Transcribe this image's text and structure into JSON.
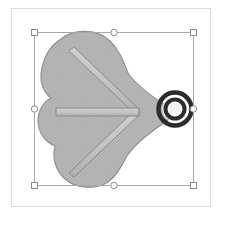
{
  "app": {
    "background_color": "#ffffff",
    "canvas": {
      "name": "drawing-canvas",
      "background_color": "#ffffff",
      "border_color": "#dcdcdc",
      "x": 11,
      "y": 8,
      "width": 200,
      "height": 199
    }
  },
  "artwork": {
    "title": "",
    "blob": {
      "name": "cloud-blob-shape",
      "fill_color": "#b4b4b4",
      "stroke_color": "#8e8e8e",
      "texture": "dither-halftone",
      "description": "three-lobed cloud shape tapering to a point on the right"
    },
    "arrow": {
      "name": "arrow-glyph",
      "fill_color": "#c2c2c2",
      "stroke_color": "#8a8a8a",
      "description": "rightward arrow: horizontal shaft with two diagonal barbs meeting at a point"
    },
    "target": {
      "name": "concentric-ring-target",
      "outer_ring_color": "#2b2b2b",
      "gap_color": "#ffffff",
      "inner_ring_color": "#2b2b2b",
      "center_color": "#f2f2f2",
      "center_x": 174,
      "center_y": 108,
      "outer_radius": 17
    }
  },
  "selection": {
    "name": "selection-bounding-box",
    "line_color": "#a8a8a8",
    "handle_fill": "#ffffff",
    "handle_stroke": "#8c8c8c",
    "box": {
      "left": 33,
      "top": 31,
      "right": 192,
      "bottom": 184
    },
    "handles": [
      {
        "name": "handle-top-left",
        "shape": "square",
        "x": 33,
        "y": 31
      },
      {
        "name": "handle-top-center",
        "shape": "round",
        "x": 112,
        "y": 31
      },
      {
        "name": "handle-top-right",
        "shape": "square",
        "x": 192,
        "y": 31
      },
      {
        "name": "handle-middle-left",
        "shape": "round",
        "x": 33,
        "y": 108
      },
      {
        "name": "handle-middle-right",
        "shape": "round",
        "x": 192,
        "y": 108
      },
      {
        "name": "handle-bottom-left",
        "shape": "square",
        "x": 33,
        "y": 184
      },
      {
        "name": "handle-bottom-center",
        "shape": "round",
        "x": 112,
        "y": 184
      },
      {
        "name": "handle-bottom-right",
        "shape": "square",
        "x": 192,
        "y": 184
      }
    ]
  }
}
